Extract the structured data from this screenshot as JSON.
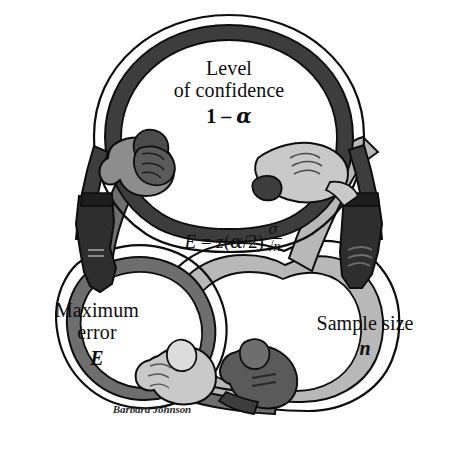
{
  "figure": {
    "background_color": "#ffffff",
    "ink_color": "#0d0d0d"
  },
  "rings": [
    {
      "id": "confidence",
      "position": "top",
      "color": "#3d3d3d",
      "label_line1": "Level",
      "label_line2": "of confidence",
      "symbol_prefix": "1 – ",
      "symbol_greek": "α"
    },
    {
      "id": "maximum-error",
      "position": "bottom-left",
      "color": "#6e6e6e",
      "label_line1": "Maximum",
      "label_line2": "error",
      "symbol": "E"
    },
    {
      "id": "sample-size",
      "position": "bottom-right",
      "color": "#b8b8b8",
      "label_line1": "Sample size",
      "label_line2": "",
      "symbol": "n"
    }
  ],
  "formula": {
    "lhs": "E",
    "equals": "=",
    "z": "z",
    "open_paren": "(",
    "alpha": "α",
    "slash": "/2",
    "close_paren": ")",
    "numerator": "σ",
    "denominator_radical": "√",
    "denominator_value": "n",
    "plain_text": "E = z(α/2)σ/√n"
  },
  "handshakes": [
    {
      "id": "top-left-clasp",
      "hand_a_color": "#8d8d8d",
      "hand_b_color": "#3d3d3d"
    },
    {
      "id": "top-right-clasp",
      "hand_a_color": "#c9c9c9",
      "hand_b_color": "#3d3d3d"
    },
    {
      "id": "bottom-center-clasp",
      "hand_a_color": "#c9c9c9",
      "hand_b_color": "#5a5a5a"
    }
  ],
  "cuffs": [
    {
      "id": "left-cuff-glove",
      "color": "#2e2e2e"
    },
    {
      "id": "right-cuff-glove",
      "color": "#2e2e2e"
    },
    {
      "id": "bottom-left-cuff",
      "color": "#2e2e2e"
    }
  ],
  "signature": {
    "artist": "Barbara Johnson"
  }
}
